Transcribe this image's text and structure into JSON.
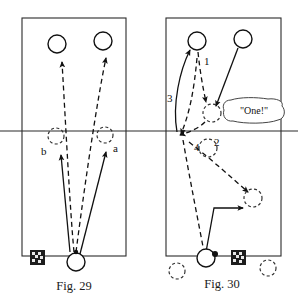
{
  "page": {
    "background_color": "#ffffff",
    "ink_color": "#111111",
    "width": 298,
    "height": 304
  },
  "figures": [
    {
      "id": "fig-29",
      "caption": "Fig. 29",
      "court": {
        "x": 22,
        "y": 18,
        "width": 104,
        "height": 238,
        "net_y": 131
      },
      "players": [
        {
          "name": "opponent-left",
          "style": "solid",
          "cx": 57,
          "cy": 44,
          "r": 9
        },
        {
          "name": "opponent-right",
          "style": "solid",
          "cx": 103,
          "cy": 41,
          "r": 9
        },
        {
          "name": "target-b",
          "style": "dashed",
          "cx": 56,
          "cy": 136,
          "r": 8
        },
        {
          "name": "target-a",
          "style": "dashed",
          "cx": 105,
          "cy": 135,
          "r": 8
        },
        {
          "name": "server",
          "style": "solid",
          "cx": 76,
          "cy": 262,
          "r": 9
        }
      ],
      "labels": [
        {
          "name": "label-b",
          "text": "b",
          "x": 41,
          "y": 155
        },
        {
          "name": "label-a",
          "text": "a",
          "x": 113,
          "y": 152
        }
      ],
      "shots": [
        {
          "name": "shuttle-path-to-left-opponent",
          "style": "dashed"
        },
        {
          "name": "shuttle-path-to-right-opponent",
          "style": "dashed"
        },
        {
          "name": "player-move-to-b",
          "style": "solid"
        },
        {
          "name": "player-move-to-a",
          "style": "solid"
        }
      ],
      "markers": [
        {
          "name": "shuttle-marker-icon",
          "x": 30,
          "y": 250
        }
      ]
    },
    {
      "id": "fig-30",
      "caption": "Fig. 30",
      "court": {
        "x": 166,
        "y": 18,
        "width": 115,
        "height": 238,
        "net_y": 131
      },
      "players": [
        {
          "name": "opponent-left",
          "style": "solid",
          "cx": 197,
          "cy": 41,
          "r": 9
        },
        {
          "name": "opponent-right",
          "style": "solid",
          "cx": 243,
          "cy": 39,
          "r": 9
        },
        {
          "name": "shuttle-drop-zone",
          "style": "dashed",
          "cx": 212,
          "cy": 113,
          "r": 9
        },
        {
          "name": "recovery-position",
          "style": "dashed",
          "cx": 208,
          "cy": 148,
          "r": 9
        },
        {
          "name": "midcourt-target",
          "style": "dashed",
          "cx": 253,
          "cy": 198,
          "r": 9
        },
        {
          "name": "server",
          "style": "solid",
          "cx": 206,
          "cy": 258,
          "r": 9
        },
        {
          "name": "base-left",
          "style": "dashed",
          "cx": 177,
          "cy": 271,
          "r": 8
        },
        {
          "name": "base-right",
          "style": "dashed",
          "cx": 268,
          "cy": 268,
          "r": 8
        }
      ],
      "labels": [
        {
          "name": "label-1",
          "text": "1",
          "x": 204,
          "y": 65
        },
        {
          "name": "label-2",
          "text": "2",
          "x": 214,
          "y": 146
        },
        {
          "name": "label-3",
          "text": "3",
          "x": 168,
          "y": 100
        },
        {
          "name": "label-4",
          "text": "4",
          "x": 194,
          "y": 151
        }
      ],
      "speech_bubble": {
        "name": "speech-bubble-one",
        "text": "\"One!\"",
        "x": 228,
        "y": 100,
        "width": 56,
        "height": 24
      },
      "shots": [
        {
          "name": "shuttle-drop-path-1",
          "style": "dashed"
        },
        {
          "name": "opponent-approach-path",
          "style": "solid"
        },
        {
          "name": "shuttle-lift-path-2",
          "style": "dashed"
        },
        {
          "name": "player-rush-path-3",
          "style": "solid"
        },
        {
          "name": "player-recover-path-4",
          "style": "dashed"
        },
        {
          "name": "shuttle-cross-path",
          "style": "dashed"
        },
        {
          "name": "player-move-bent-path",
          "style": "solid"
        }
      ],
      "markers": [
        {
          "name": "shuttle-marker-icon",
          "x": 231,
          "y": 250
        }
      ]
    }
  ]
}
